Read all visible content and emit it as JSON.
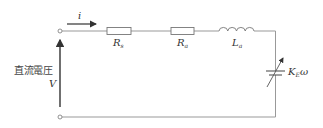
{
  "diagram": {
    "type": "circuit",
    "title": "",
    "source": {
      "label_jp": "直流電圧",
      "symbol": "V"
    },
    "current": {
      "symbol": "i"
    },
    "components": [
      {
        "id": "Rs",
        "kind": "resistor",
        "base": "R",
        "subscript": "s"
      },
      {
        "id": "Ra",
        "kind": "resistor",
        "base": "R",
        "subscript": "a"
      },
      {
        "id": "La",
        "kind": "inductor",
        "base": "L",
        "subscript": "a"
      },
      {
        "id": "KEw",
        "kind": "variable-voltage-source",
        "base": "K",
        "subscript": "E",
        "suffix": "ω"
      }
    ],
    "colors": {
      "wire": "#888888",
      "arrow": "#333333",
      "text": "#333333"
    }
  }
}
